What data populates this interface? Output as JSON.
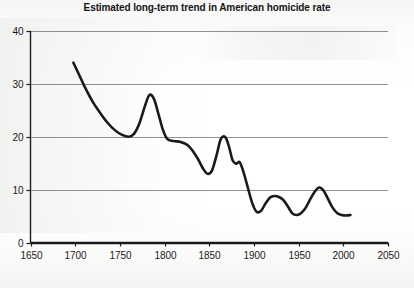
{
  "chart_data": {
    "type": "line",
    "title": "Estimated long-term trend in American homicide rate",
    "xlabel": "",
    "ylabel": "",
    "xlim": [
      1650,
      2050
    ],
    "ylim": [
      0,
      40
    ],
    "xticks": [
      1650,
      1700,
      1750,
      1800,
      1850,
      1900,
      1950,
      2000,
      2050
    ],
    "xtick_labels": [
      "1650",
      "1700",
      "1750",
      "1800",
      "1850",
      "1900",
      "1950",
      "2000",
      "2050"
    ],
    "yticks": [
      0,
      10,
      20,
      30,
      40
    ],
    "ytick_labels": [
      "0",
      "10",
      "20",
      "30",
      "40"
    ],
    "grid": "horizontal",
    "legend": "none",
    "line_color": "#1a1a1a",
    "line_width": 2.6,
    "series": [
      {
        "name": "American homicide rate",
        "units": "homicides per 100,000 per year",
        "x": [
          1698,
          1705,
          1712,
          1720,
          1728,
          1736,
          1744,
          1752,
          1760,
          1766,
          1772,
          1778,
          1783,
          1788,
          1793,
          1798,
          1803,
          1810,
          1818,
          1826,
          1832,
          1838,
          1843,
          1848,
          1853,
          1858,
          1863,
          1868,
          1872,
          1876,
          1880,
          1884,
          1888,
          1893,
          1898,
          1903,
          1908,
          1913,
          1918,
          1923,
          1928,
          1933,
          1938,
          1943,
          1948,
          1953,
          1958,
          1963,
          1968,
          1973,
          1978,
          1983,
          1988,
          1993,
          1998,
          2003,
          2008
        ],
        "y": [
          34.0,
          31.5,
          29.0,
          26.5,
          24.5,
          22.7,
          21.3,
          20.4,
          20.0,
          20.6,
          22.6,
          25.8,
          27.9,
          27.2,
          24.4,
          21.4,
          19.6,
          19.2,
          19.0,
          18.4,
          17.2,
          15.6,
          14.0,
          13.0,
          13.6,
          16.4,
          19.6,
          19.9,
          18.2,
          15.6,
          14.9,
          15.2,
          13.5,
          10.5,
          7.5,
          5.8,
          6.0,
          7.4,
          8.5,
          8.8,
          8.6,
          8.0,
          6.8,
          5.5,
          5.2,
          5.6,
          6.6,
          8.2,
          9.6,
          10.4,
          9.8,
          8.2,
          6.6,
          5.6,
          5.2,
          5.1,
          5.2
        ]
      }
    ],
    "annotations": []
  },
  "figure": {
    "background_color": "#ffffff",
    "axis_color": "#1a1a1a",
    "gridline_color": "#8f8f8f"
  }
}
